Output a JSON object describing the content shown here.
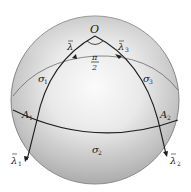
{
  "figure": {
    "type": "spherical-geometry-diagram",
    "labels": {
      "origin": "O",
      "angle_num": "π",
      "angle_den": "2",
      "lambda_top_left": "λ",
      "lambda_top_right": "λ",
      "lambda_top_right_sub": "3",
      "lambda_bottom_left": "λ",
      "lambda_bottom_left_sub": "1",
      "lambda_bottom_right": "λ",
      "lambda_bottom_right_sub": "2",
      "sigma_left": "σ",
      "sigma_left_sub": "1",
      "sigma_right": "σ",
      "sigma_right_sub": "3",
      "sigma_bottom": "σ",
      "sigma_bottom_sub": "2",
      "point_left": "A",
      "point_left_sub": "1",
      "point_right": "A",
      "point_right_sub": "2"
    },
    "colors": {
      "sphere_light": "#f4f4f4",
      "sphere_mid": "#d6d6d6",
      "sphere_dark": "#a9a9a9",
      "line": "#1e1e1e",
      "thin_line": "#555555"
    }
  }
}
